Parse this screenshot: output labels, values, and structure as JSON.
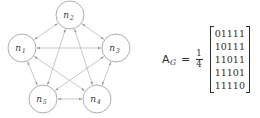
{
  "figure": {
    "type": "graph-with-adjacency-matrix",
    "background_color": "#ffffff",
    "ink_color": "#2e2e2e",
    "edge_color": "#9a9a9a",
    "node_stroke_color": "#8a8a8a"
  },
  "graph": {
    "name": "complete-graph-k5",
    "layout": "pentagon",
    "directed": "bidirectional",
    "nodes": [
      {
        "id": "n1",
        "base": "n",
        "subscript": "1",
        "label": "n1",
        "cx": 22,
        "cy": 48
      },
      {
        "id": "n2",
        "base": "n",
        "subscript": "2",
        "label": "n2",
        "cx": 70,
        "cy": 15
      },
      {
        "id": "n3",
        "base": "n",
        "subscript": "3",
        "label": "n3",
        "cx": 116,
        "cy": 48
      },
      {
        "id": "n4",
        "base": "n",
        "subscript": "4",
        "label": "n4",
        "cx": 97,
        "cy": 99
      },
      {
        "id": "n5",
        "base": "n",
        "subscript": "5",
        "label": "n5",
        "cx": 43,
        "cy": 99
      }
    ],
    "node_radius": 14,
    "edges": [
      {
        "from": "n1",
        "to": "n2"
      },
      {
        "from": "n1",
        "to": "n3"
      },
      {
        "from": "n1",
        "to": "n4"
      },
      {
        "from": "n1",
        "to": "n5"
      },
      {
        "from": "n2",
        "to": "n3"
      },
      {
        "from": "n2",
        "to": "n4"
      },
      {
        "from": "n2",
        "to": "n5"
      },
      {
        "from": "n3",
        "to": "n4"
      },
      {
        "from": "n3",
        "to": "n5"
      },
      {
        "from": "n4",
        "to": "n5"
      }
    ]
  },
  "matrix_expression": {
    "symbol_base": "A",
    "symbol_subscript": "G",
    "equals": "=",
    "scalar": {
      "numerator": "1",
      "denominator": "4"
    },
    "matrix": {
      "rows": [
        "01111",
        "10111",
        "11011",
        "11101",
        "11110"
      ],
      "values": [
        [
          0,
          1,
          1,
          1,
          1
        ],
        [
          1,
          0,
          1,
          1,
          1
        ],
        [
          1,
          1,
          0,
          1,
          1
        ],
        [
          1,
          1,
          1,
          0,
          1
        ],
        [
          1,
          1,
          1,
          1,
          0
        ]
      ],
      "bracket_left": "[",
      "bracket_right": "]"
    }
  }
}
